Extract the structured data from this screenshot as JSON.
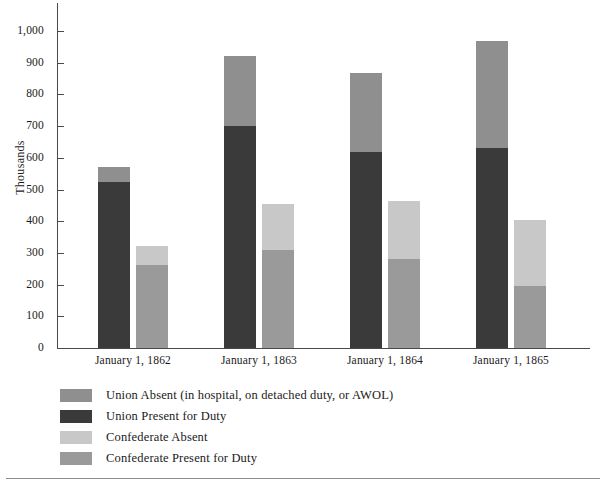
{
  "chart_data": {
    "type": "bar",
    "subtype": "grouped-stacked-bar",
    "title": "",
    "xlabel": "",
    "ylabel": "Thousands",
    "ylim": [
      0,
      1000
    ],
    "ytick_step": 100,
    "ytick_labels": [
      "0",
      "100",
      "200",
      "300",
      "400",
      "500",
      "600",
      "700",
      "800",
      "900",
      "1,000"
    ],
    "ytick_values": [
      0,
      100,
      200,
      300,
      400,
      500,
      600,
      700,
      800,
      900,
      1000
    ],
    "grid": false,
    "legend_position": "below-plot",
    "categories": [
      "January 1, 1862",
      "January 1, 1863",
      "January 1, 1864",
      "January 1, 1865"
    ],
    "series": [
      {
        "name": "Union Present for Duty",
        "stack": "Union",
        "color": "#3a3a3a",
        "values": [
          525,
          700,
          618,
          632
        ]
      },
      {
        "name": "Union Absent (in hospital, on detached duty, or AWOL)",
        "stack": "Union",
        "color": "#8f8f8f",
        "values": [
          45,
          220,
          250,
          336
        ]
      },
      {
        "name": "Confederate Present for Duty",
        "stack": "Confederate",
        "color": "#9a9a9a",
        "values": [
          262,
          310,
          280,
          195
        ]
      },
      {
        "name": "Confederate Absent",
        "stack": "Confederate",
        "color": "#c8c8c8",
        "values": [
          60,
          143,
          183,
          210
        ]
      }
    ],
    "stack_totals": {
      "Union": [
        570,
        920,
        868,
        968
      ],
      "Confederate": [
        322,
        453,
        463,
        405
      ]
    }
  },
  "legend": {
    "items": [
      {
        "label": "Union Absent (in hospital, on detached duty, or AWOL)",
        "color": "#8f8f8f"
      },
      {
        "label": "Union Present for Duty",
        "color": "#3a3a3a"
      },
      {
        "label": "Confederate Absent",
        "color": "#c8c8c8"
      },
      {
        "label": "Confederate Present for Duty",
        "color": "#9a9a9a"
      }
    ]
  }
}
